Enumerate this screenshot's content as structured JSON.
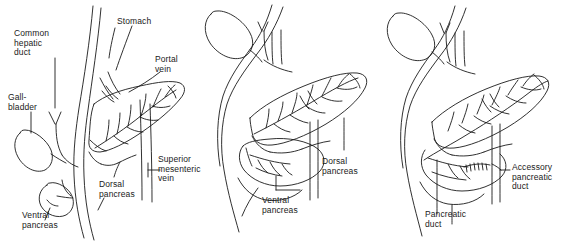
{
  "figure": {
    "background_color": "#ffffff",
    "ink_color": "#1a1a1a",
    "width": 580,
    "height": 243,
    "panel_count": 3
  },
  "panels": [
    {
      "id": "panel-1",
      "name": "early-stage",
      "labels": [
        {
          "key": "common-hepatic-duct",
          "text": "Common\nhepatic\nduct",
          "x": 14,
          "y": 29
        },
        {
          "key": "stomach",
          "text": "Stomach",
          "x": 117,
          "y": 17
        },
        {
          "key": "portal-vein",
          "text": "Portal\nvein",
          "x": 155,
          "y": 55
        },
        {
          "key": "gallbladder",
          "text": "Gall-\nbladder",
          "x": 8,
          "y": 93
        },
        {
          "key": "superior-mesenteric-vein",
          "text": "Superior\nmesenteric\nvein",
          "x": 155,
          "y": 155
        },
        {
          "key": "dorsal-pancreas",
          "text": "Dorsal\npancreas",
          "x": 99,
          "y": 180
        },
        {
          "key": "ventral-pancreas",
          "text": "Ventral\npancreas",
          "x": 22,
          "y": 211
        }
      ]
    },
    {
      "id": "panel-2",
      "name": "rotation-stage",
      "labels": [
        {
          "key": "dorsal-pancreas",
          "text": "Dorsal\npancreas",
          "x": 322,
          "y": 157
        },
        {
          "key": "ventral-pancreas",
          "text": "Ventral\npancreas",
          "x": 262,
          "y": 196
        }
      ]
    },
    {
      "id": "panel-3",
      "name": "fused-stage",
      "labels": [
        {
          "key": "accessory-pancreatic-duct",
          "text": "Accessory\npancreatic\nduct",
          "x": 512,
          "y": 163
        },
        {
          "key": "pancreatic-duct",
          "text": "Pancreatic\nduct",
          "x": 425,
          "y": 210
        }
      ]
    }
  ]
}
